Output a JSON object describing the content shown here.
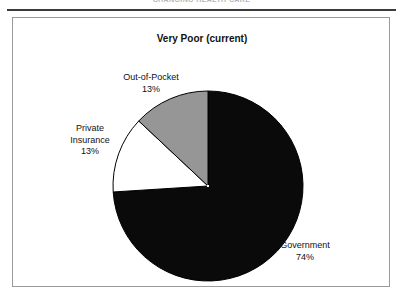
{
  "page": {
    "header_text": "CHANGING HEALTH CARE",
    "header_rule": "horizontal-rule"
  },
  "figure": {
    "title": "Very Poor (current)"
  },
  "chart_data": {
    "type": "pie",
    "title": "Very Poor (current)",
    "xlabel": "",
    "ylabel": "",
    "legend_position": "none",
    "grid": false,
    "start_angle_deg": 90,
    "direction": "clockwise",
    "categories": [
      "Government",
      "Out-of-Pocket",
      "Private Insurance"
    ],
    "values": [
      74,
      13,
      13
    ],
    "unit": "%",
    "slices": [
      {
        "label": "Government",
        "value": 74,
        "value_label": "74%",
        "color": "#0a0a0a"
      },
      {
        "label": "Out-of-Pocket",
        "value": 13,
        "value_label": "13%",
        "color": "#ffffff"
      },
      {
        "label": "Private Insurance",
        "label_line1": "Private",
        "label_line2": "Insurance",
        "value": 13,
        "value_label": "13%",
        "color": "#969696"
      }
    ],
    "colors": {
      "government": "#0a0a0a",
      "out_of_pocket": "#ffffff",
      "private_insurance": "#969696",
      "slice_outline": "#000000",
      "frame_border": "#9a9a9a",
      "background": "#ffffff"
    }
  }
}
